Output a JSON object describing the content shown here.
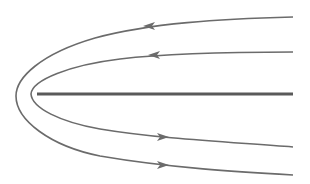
{
  "diagram": {
    "title": "Flow lines around a flat plate (streamlines reversing around plate edge)",
    "colors": {
      "background": "#ffffff",
      "stroke": "#6b6b6b",
      "plate": "#5a5a5a"
    },
    "plate": {
      "x1": 37,
      "y1": 94,
      "x2": 293,
      "y2": 94,
      "width": 3
    },
    "streamlines": [
      {
        "id": "outer-top",
        "path": "M 293 17 C 220 19, 150 23, 95 38 C 40 54, 16 78, 16 96",
        "arrow": {
          "x": 150,
          "y": 26,
          "dir": "left"
        }
      },
      {
        "id": "inner-top",
        "path": "M 293 52 C 230 52, 170 53, 120 59 C 70 65, 32 80, 31 94",
        "arrow": {
          "x": 155,
          "y": 55,
          "dir": "left"
        }
      },
      {
        "id": "inner-bottom",
        "path": "M 31 94 C 32 108, 60 122, 100 129 C 160 139, 230 142, 293 147",
        "arrow": {
          "x": 162,
          "y": 137,
          "dir": "right"
        }
      },
      {
        "id": "outer-bottom",
        "path": "M 16 96 C 16 120, 50 146, 100 156 C 170 168, 240 172, 293 175",
        "arrow": {
          "x": 162,
          "y": 165,
          "dir": "right"
        }
      }
    ]
  }
}
